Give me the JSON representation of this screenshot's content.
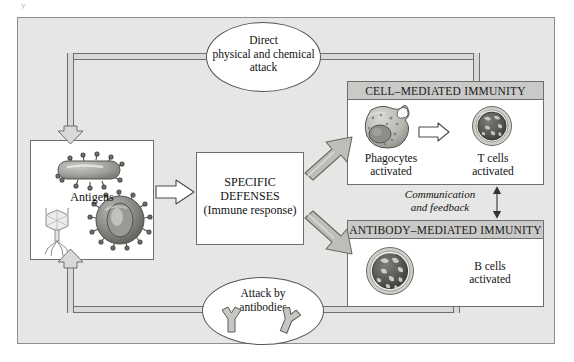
{
  "figure": {
    "type": "flow-diagram",
    "background_color": "#e6e6e4",
    "frame_border_color": "#8e8e8e",
    "corner_artifact": "y"
  },
  "antigen_box": {
    "label": "Antigens",
    "organisms": [
      "bacterium",
      "bacteriophage",
      "virus"
    ]
  },
  "specific_defenses": {
    "line1": "SPECIFIC",
    "line2": "DEFENSES",
    "line3": "(Immune response)"
  },
  "cell_mediated": {
    "title": "CELL–MEDIATED IMMUNITY",
    "title_bar_color": "#c9c9c7",
    "left_cell": {
      "line1": "Phagocytes",
      "line2": "activated",
      "icon": "phagocyte-cell"
    },
    "right_cell": {
      "line1": "T cells",
      "line2": "activated",
      "icon": "t-cell"
    },
    "inner_arrow": "hollow-right-arrow"
  },
  "antibody_mediated": {
    "title": "ANTIBODY–MEDIATED IMMUNITY",
    "title_bar_color": "#c9c9c7",
    "cell": {
      "line1": "B cells",
      "line2": "activated",
      "icon": "b-cell"
    }
  },
  "feedback": {
    "line1": "Communication",
    "line2": "and feedback",
    "arrow": "double-headed-vertical-arrow"
  },
  "top_ellipse": {
    "line1": "Direct",
    "line2": "physical and chemical",
    "line3": "attack"
  },
  "bottom_ellipse": {
    "line1": "Attack by",
    "line2": "antibodies",
    "icons": [
      "antibody-y-glyph",
      "antibody-y-glyph"
    ]
  },
  "arrows": {
    "antigens_to_defenses": "hollow-block-arrow-right",
    "defenses_to_cell_mediated": "gray-block-arrow-up-right",
    "defenses_to_antibody_mediated": "gray-block-arrow-down-right",
    "into_antigens_top": "hollow-block-arrow-down",
    "into_antigens_bottom": "hollow-block-arrow-up"
  }
}
